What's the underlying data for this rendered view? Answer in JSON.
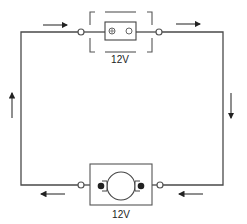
{
  "diagram": {
    "type": "series circuit",
    "colors": {
      "wire": "#4a4a4a",
      "ink": "#222222",
      "background": "#ffffff"
    },
    "components": {
      "switch": {
        "label": "12V",
        "icon": "switch-icon"
      },
      "motor": {
        "label": "12V",
        "icon": "motor-icon"
      }
    },
    "current_arrows": [
      {
        "position": "top-left",
        "direction": "right"
      },
      {
        "position": "top-right",
        "direction": "right"
      },
      {
        "position": "right",
        "direction": "down"
      },
      {
        "position": "bottom-right",
        "direction": "left"
      },
      {
        "position": "bottom-left",
        "direction": "left"
      },
      {
        "position": "left",
        "direction": "up"
      }
    ]
  }
}
